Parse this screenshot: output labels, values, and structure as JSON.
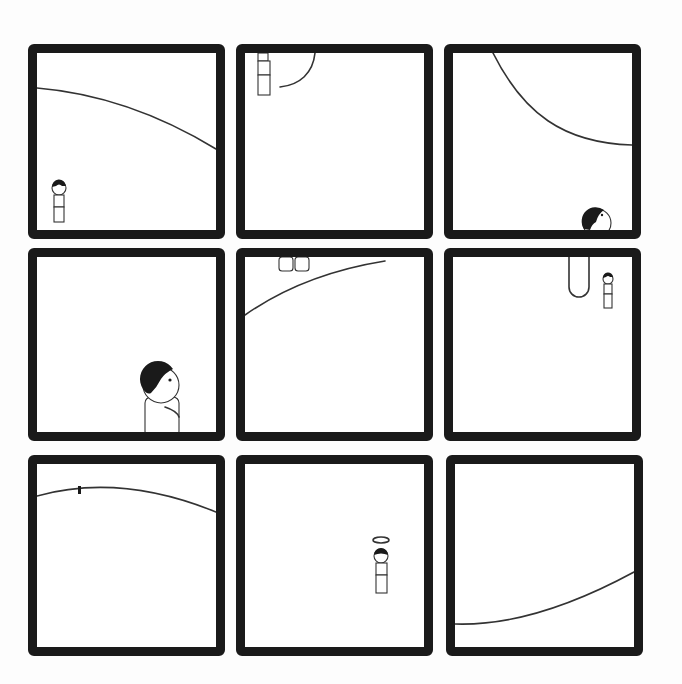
{
  "comic": {
    "layout": "3x3 grid",
    "panel_count": 9,
    "border_color": "#1a1a1a",
    "background_color": "#ffffff",
    "panels": [
      {
        "id": 1,
        "description": "small figure standing bottom-left under a large curved horizon line"
      },
      {
        "id": 2,
        "description": "figure hanging upside-down at top-left near arc"
      },
      {
        "id": 3,
        "description": "large curve from top, head peeking from bottom right"
      },
      {
        "id": 4,
        "description": "close-up of boy looking up"
      },
      {
        "id": 5,
        "description": "feet at top, diagonal line"
      },
      {
        "id": 6,
        "description": "loop hanging from top, small figure looking up"
      },
      {
        "id": 7,
        "description": "tiny figure on top of curved horizon"
      },
      {
        "id": 8,
        "description": "figure with halo"
      },
      {
        "id": 9,
        "description": "empty panel with curve at bottom"
      }
    ]
  }
}
